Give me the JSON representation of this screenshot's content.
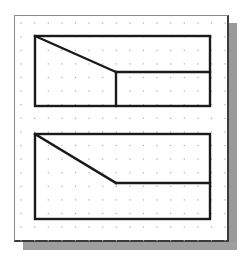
{
  "canvas": {
    "width": 245,
    "height": 262,
    "background": "#ffffff",
    "panel_border": "#3a3a3a",
    "shadow_color": "#9c9c9c",
    "stroke_color": "#1a1a1a",
    "dot_color": "#a8a8a8"
  },
  "grid": {
    "x_start": 21,
    "y_start": 23,
    "spacing": 13.6,
    "cols": 16,
    "rows": 17
  },
  "views": [
    {
      "name": "top-view",
      "rect": {
        "x": 35,
        "y": 36,
        "w": 175,
        "h": 70
      },
      "lines": [
        {
          "x1": 35,
          "y1": 36,
          "x2": 116,
          "y2": 72
        },
        {
          "x1": 116,
          "y1": 72,
          "x2": 210,
          "y2": 72
        },
        {
          "x1": 116,
          "y1": 72,
          "x2": 116,
          "y2": 106
        }
      ]
    },
    {
      "name": "front-view",
      "rect": {
        "x": 35,
        "y": 134,
        "w": 175,
        "h": 85
      },
      "lines": [
        {
          "x1": 35,
          "y1": 134,
          "x2": 116,
          "y2": 183
        },
        {
          "x1": 116,
          "y1": 183,
          "x2": 210,
          "y2": 183
        }
      ]
    }
  ]
}
